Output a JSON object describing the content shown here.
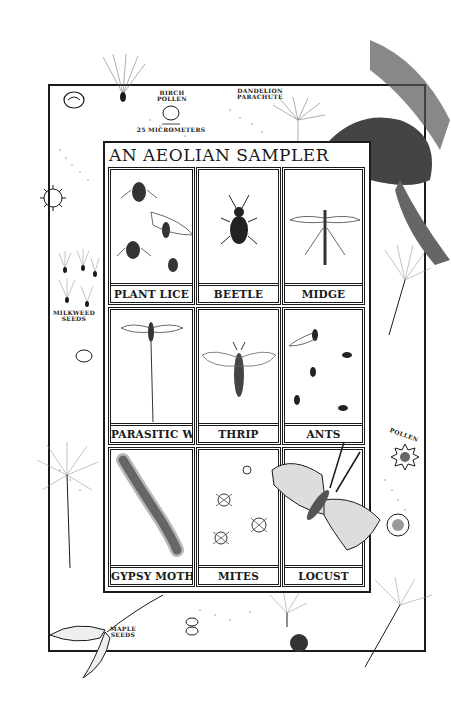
{
  "title": "AN AEOLIAN SAMPLER",
  "scale_notes": {
    "birch_pollen": "BIRCH POLLEN",
    "dandelion_parachute": "DANDELION PARACHUTE",
    "scale_bar": "25 MICROMETERS"
  },
  "margin_labels": {
    "milkweed_seeds": "MILKWEED SEEDS",
    "pollen": "POLLEN",
    "maple_seeds": "MAPLE SEEDS"
  },
  "cells": [
    {
      "label": "PLANT LICE",
      "icon": "plant-lice-icon"
    },
    {
      "label": "BEETLE",
      "icon": "beetle-icon"
    },
    {
      "label": "MIDGE",
      "icon": "midge-icon"
    },
    {
      "label": "PARASITIC WASP",
      "icon": "parasitic-wasp-icon"
    },
    {
      "label": "THRIP",
      "icon": "thrip-icon"
    },
    {
      "label": "ANTS",
      "icon": "ants-icon"
    },
    {
      "label": "GYPSY MOTH-larva-",
      "icon": "gypsy-moth-larva-icon"
    },
    {
      "label": "MITES",
      "icon": "mites-icon"
    },
    {
      "label": "LOCUST",
      "icon": "locust-icon"
    }
  ],
  "colors": {
    "ink": "#1a1a1a",
    "paper": "#ffffff",
    "stipple": "#8a8a8a"
  }
}
